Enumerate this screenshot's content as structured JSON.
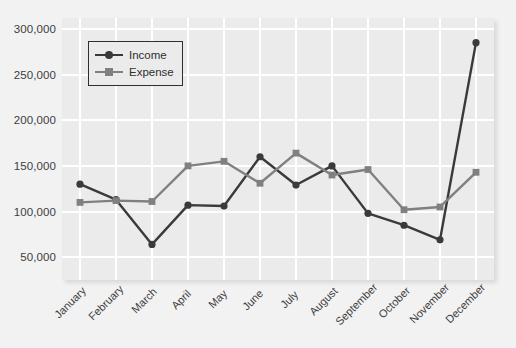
{
  "chart_data": {
    "type": "line",
    "title": "",
    "xlabel": "",
    "ylabel": "",
    "grid": true,
    "legend_position": "top-left-inside",
    "ylim": [
      25000,
      312000
    ],
    "yticks": [
      50000,
      100000,
      150000,
      200000,
      250000,
      300000
    ],
    "ytick_labels": [
      "50,000",
      "100,000",
      "150,000",
      "200,000",
      "250,000",
      "300,000"
    ],
    "categories": [
      "January",
      "February",
      "March",
      "April",
      "May",
      "June",
      "July",
      "August",
      "September",
      "October",
      "November",
      "December"
    ],
    "series": [
      {
        "name": "Income",
        "color": "#3a3a3a",
        "marker": "circle",
        "values": [
          130000,
          113000,
          64000,
          107000,
          106000,
          160000,
          129000,
          150000,
          98000,
          85000,
          69000,
          285000
        ]
      },
      {
        "name": "Expense",
        "color": "#808080",
        "marker": "square",
        "values": [
          110000,
          112000,
          111000,
          150000,
          155000,
          131000,
          164000,
          140000,
          146000,
          102000,
          105000,
          143000
        ]
      }
    ]
  },
  "legend": {
    "items": [
      {
        "label": "Income"
      },
      {
        "label": "Expense"
      }
    ]
  },
  "colors": {
    "income": "#3a3a3a",
    "expense": "#808080",
    "panel": "#ebebeb",
    "page": "#f2f2f2",
    "grid": "#ffffff",
    "text": "#3d3d3d"
  }
}
